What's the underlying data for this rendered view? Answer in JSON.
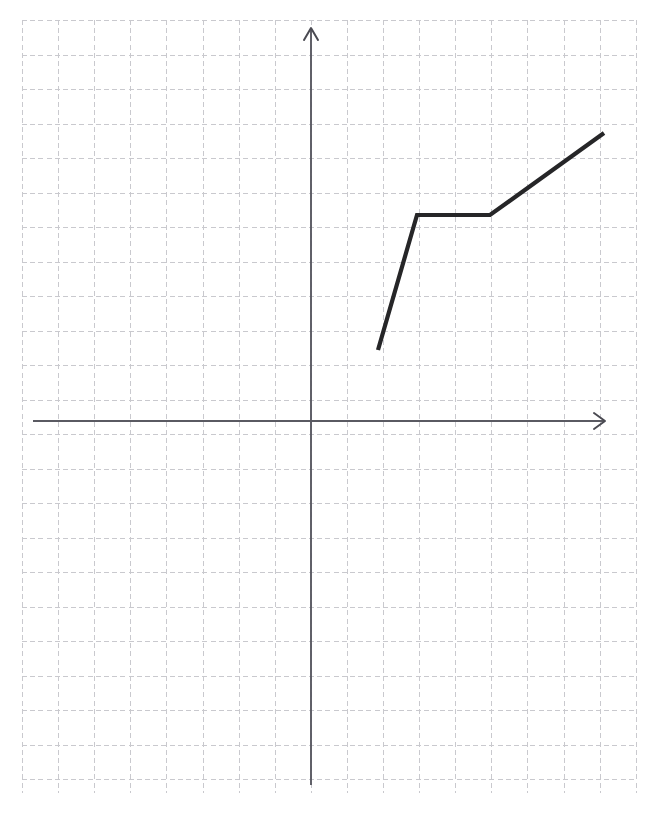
{
  "page": {
    "background_color": "#ffffff",
    "width": 663,
    "height": 838
  },
  "chart_data": {
    "type": "line",
    "title": "",
    "subtitle": "",
    "xlabel": "",
    "ylabel": "",
    "legend": [],
    "annotations": [],
    "grid": true,
    "grid_style": "dashed",
    "grid_color": "#c9c9ce",
    "grid_cell_px": {
      "x": 36.1,
      "y": 34.5
    },
    "grid_extent_px": {
      "x0": 22,
      "y0": 20,
      "x1": 636,
      "y1": 793
    },
    "axes": {
      "origin_px": {
        "x": 311,
        "y": 421
      },
      "x_axis_px": {
        "x_start": 33,
        "x_end": 605,
        "y": 421
      },
      "y_axis_px": {
        "y_start": 785,
        "y_end": 28,
        "x": 311
      },
      "x_arrow": "right",
      "y_arrow": "up",
      "axis_color": "#5a5a62",
      "xlim": [
        -8.0,
        8.7
      ],
      "ylim": [
        -10.6,
        11.4
      ],
      "tick_labels_x": [],
      "tick_labels_y": []
    },
    "series": [
      {
        "name": "piecewise-curve",
        "color": "#262628",
        "stroke_width_px": 4.2,
        "points_px": [
          {
            "x": 378,
            "y": 350
          },
          {
            "x": 417,
            "y": 215
          },
          {
            "x": 490,
            "y": 215
          },
          {
            "x": 604,
            "y": 133
          }
        ],
        "points_units": [
          {
            "x": 1.86,
            "y": 2.06
          },
          {
            "x": 2.94,
            "y": 5.97
          },
          {
            "x": 4.96,
            "y": 5.97
          },
          {
            "x": 8.12,
            "y": 8.35
          }
        ],
        "segments": [
          {
            "from": 0,
            "to": 1,
            "description": "steep rise"
          },
          {
            "from": 1,
            "to": 2,
            "description": "horizontal plateau"
          },
          {
            "from": 2,
            "to": 3,
            "description": "moderate rise"
          }
        ]
      }
    ]
  }
}
